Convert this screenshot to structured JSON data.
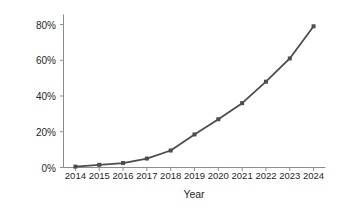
{
  "chart_data": {
    "type": "line",
    "title": "",
    "xlabel": "Year",
    "ylabel": "Customer penetration",
    "categories": [
      "2014",
      "2015",
      "2016",
      "2017",
      "2018",
      "2019",
      "2020",
      "2021",
      "2022",
      "2023",
      "2024"
    ],
    "x": [
      2014,
      2015,
      2016,
      2017,
      2018,
      2019,
      2020,
      2021,
      2022,
      2023,
      2024
    ],
    "values": [
      0.5,
      1.5,
      2.5,
      5,
      9.5,
      18.5,
      27,
      36,
      48,
      61,
      79
    ],
    "ylim": [
      0,
      85
    ],
    "ytick_values": [
      0,
      20,
      40,
      60,
      80
    ],
    "ytick_labels": [
      "0%",
      "20%",
      "40%",
      "60%",
      "80%"
    ],
    "xtick_labels": [
      "2014",
      "2015",
      "2016",
      "2017",
      "2018",
      "2019",
      "2020",
      "2021",
      "2022",
      "2023",
      "2024"
    ],
    "grid": false,
    "legend": false,
    "legend_position": "none",
    "series": [
      {
        "name": "Customer penetration",
        "values": [
          0.5,
          1.5,
          2.5,
          5,
          9.5,
          18.5,
          27,
          36,
          48,
          61,
          79
        ],
        "color": "#4d4d4d",
        "marker": "square",
        "line_width": 1.8
      }
    ],
    "colors": {
      "line": "#4d4d4d",
      "marker": "#4d4d4d",
      "axis": "#8c8c8c",
      "text": "#262626",
      "background": "#ffffff"
    }
  },
  "axes": {
    "y_title": "Customer penetration",
    "x_title": "Year"
  }
}
